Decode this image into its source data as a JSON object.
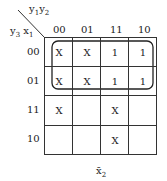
{
  "kmap": {
    "row_var_label": "y3 x1",
    "col_var_label": "y1 y2",
    "col_headers": [
      "00",
      "01",
      "11",
      "10"
    ],
    "row_headers": [
      "00",
      "01",
      "11",
      "10"
    ],
    "cells": [
      [
        "X",
        "X",
        "1",
        "1"
      ],
      [
        "X",
        "X",
        "1",
        "1"
      ],
      [
        "X",
        "",
        "X",
        ""
      ],
      [
        "",
        "",
        "X",
        ""
      ]
    ],
    "group": {
      "rows": [
        0,
        1
      ],
      "cols": [
        0,
        1,
        2,
        3
      ]
    },
    "result_label": "x̄2"
  }
}
